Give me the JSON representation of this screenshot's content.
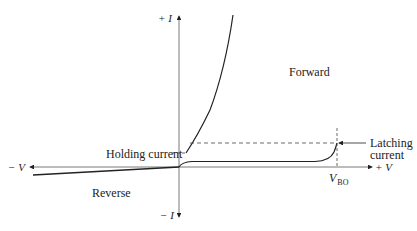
{
  "diagram": {
    "type": "thyristor_iv_characteristic",
    "axes": {
      "y_positive_label": "+ I",
      "y_negative_label": "− I",
      "x_positive_label": "+ V",
      "x_negative_label": "− V"
    },
    "regions": {
      "forward": "Forward",
      "reverse": "Reverse"
    },
    "annotations": {
      "holding_current": "Holding current",
      "latching_current_line1": "Latching",
      "latching_current_line2": "current",
      "breakover_voltage_main": "V",
      "breakover_voltage_sub": "BO"
    },
    "colors": {
      "line": "#222222",
      "axis": "#555555",
      "background": "#ffffff"
    }
  }
}
